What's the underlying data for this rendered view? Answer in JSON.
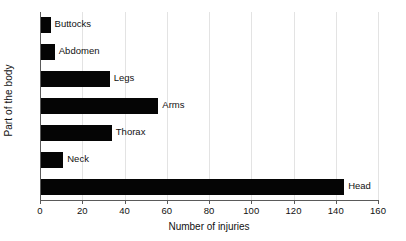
{
  "chart_data": {
    "type": "bar",
    "orientation": "horizontal",
    "title": "",
    "xlabel": "Number of injuries",
    "ylabel": "Part of the body",
    "categories": [
      "Buttocks",
      "Abdomen",
      "Legs",
      "Arms",
      "Thorax",
      "Neck",
      "Head"
    ],
    "values": [
      5,
      7,
      33,
      56,
      34,
      11,
      144
    ],
    "xlim": [
      0,
      160
    ],
    "xticks": [
      0,
      20,
      40,
      60,
      80,
      100,
      120,
      140,
      160
    ],
    "xtick_labels": [
      "0",
      "20",
      "40",
      "60",
      "80",
      "100",
      "120",
      "140",
      "160"
    ],
    "grid": "vertical",
    "legend": "none",
    "bar_color": "#050505",
    "bar_labels_inside_plot": true,
    "category_order_top_to_bottom": [
      "Buttocks",
      "Abdomen",
      "Legs",
      "Arms",
      "Thorax",
      "Neck",
      "Head"
    ]
  },
  "style": {
    "background": "#ffffff",
    "axis_color": "#5a5a5a",
    "grid_color": "#e3e3e3",
    "text_color": "#111111"
  }
}
